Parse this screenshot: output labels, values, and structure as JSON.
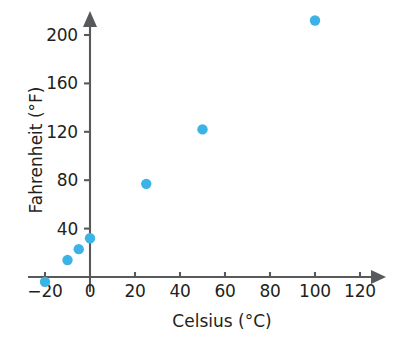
{
  "chart_data": {
    "type": "scatter",
    "title": "",
    "xlabel": "Celsius (°C)",
    "ylabel": "Fahrenheit (°F)",
    "xlim": [
      -25,
      130
    ],
    "ylim": [
      -12,
      225
    ],
    "grid": false,
    "legend": null,
    "x_ticks": [
      {
        "value": -20,
        "label": "−20"
      },
      {
        "value": 0,
        "label": "0"
      },
      {
        "value": 20,
        "label": "20"
      },
      {
        "value": 40,
        "label": "40"
      },
      {
        "value": 60,
        "label": "60"
      },
      {
        "value": 80,
        "label": "80"
      },
      {
        "value": 100,
        "label": "100"
      },
      {
        "value": 120,
        "label": "120"
      }
    ],
    "y_ticks": [
      {
        "value": 40,
        "label": "40"
      },
      {
        "value": 80,
        "label": "80"
      },
      {
        "value": 120,
        "label": "120"
      },
      {
        "value": 160,
        "label": "160"
      },
      {
        "value": 200,
        "label": "200"
      }
    ],
    "series": [
      {
        "name": "Celsius to Fahrenheit conversions",
        "color": "#3bb3e4",
        "marker": "circle",
        "points": [
          {
            "x": -20,
            "y": -4
          },
          {
            "x": -10,
            "y": 14
          },
          {
            "x": -5,
            "y": 23
          },
          {
            "x": 0,
            "y": 32
          },
          {
            "x": 25,
            "y": 77
          },
          {
            "x": 50,
            "y": 122
          },
          {
            "x": 100,
            "y": 212
          }
        ]
      }
    ]
  },
  "axes": {
    "x_title": "Celsius (°C)",
    "y_title": "Fahrenheit (°F)"
  },
  "colors": {
    "marker": "#3bb3e4",
    "axis": "#58595b",
    "text": "#231f20",
    "background": "#ffffff"
  }
}
